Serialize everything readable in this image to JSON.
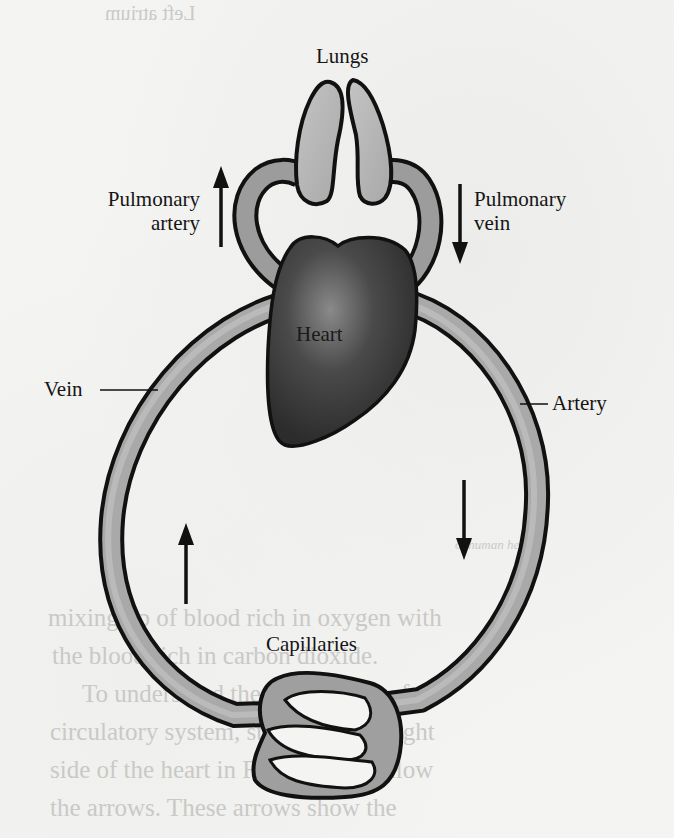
{
  "diagram": {
    "type": "double circulation schematic",
    "labels": {
      "lungs": "Lungs",
      "pulmonary_artery_line1": "Pulmonary",
      "pulmonary_artery_line2": "artery",
      "pulmonary_vein_line1": "Pulmonary",
      "pulmonary_vein_line2": "vein",
      "heart": "Heart",
      "vein": "Vein",
      "artery": "Artery",
      "capillaries": "Capillaries"
    },
    "arrows": [
      {
        "name": "pulmonary-artery-arrow",
        "direction": "up"
      },
      {
        "name": "pulmonary-vein-arrow",
        "direction": "down"
      },
      {
        "name": "artery-flow-arrow",
        "direction": "down"
      },
      {
        "name": "vein-flow-arrow",
        "direction": "up"
      }
    ],
    "colors": {
      "vessel_fill": "#a9a9a9",
      "vessel_outline": "#111111",
      "heart_fill": "#3e3e3e",
      "lung_fill": "#b5b5b5",
      "paper": "#f4f4f2"
    }
  },
  "bleed_through": {
    "top_caption": "Left atrium",
    "figure_caption_fragment": "of human heart",
    "body_lines": [
      "mixing up of blood rich in oxygen with",
      "the blood rich in carbon dioxide.",
      "To understand the functioning of the",
      "circulatory system, start from the right",
      "side of the heart in Fig. 6.3 and follow",
      "the arrows. These arrows show the"
    ]
  }
}
